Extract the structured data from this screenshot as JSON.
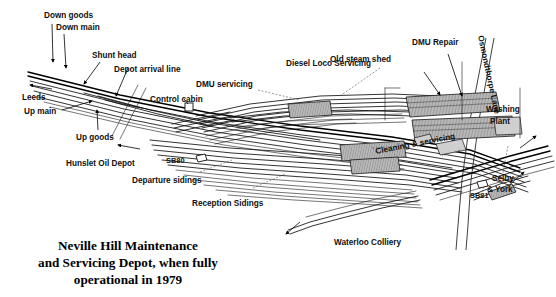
{
  "document": {
    "type": "railway-depot-track-diagram",
    "title_lines": [
      "Neville Hill Maintenance",
      "and Servicing Depot, when fully",
      "operational in 1979"
    ],
    "title_full": "Neville Hill Maintenance and Servicing Depot, when fully operational in 1979"
  },
  "colors": {
    "background": "#ffffff",
    "ink": "#111111",
    "building_fill": "#b9b9b9",
    "building_fill_light": "#cfcfcf",
    "leader_dash": "#555555"
  },
  "labels": {
    "down_goods": "Down goods",
    "down_main": "Down main",
    "shunt_head": "Shunt head",
    "depot_arrival_line": "Depot arrival line",
    "leeds": "Leeds",
    "up_main": "Up main",
    "up_goods": "Up goods",
    "control_cabin": "Control cabin",
    "dmu_servicing": "DMU servicing",
    "diesel_loco_servicing": "Diesel Loco Servicing",
    "old_steam_shed": "Old steam shed",
    "dmu_repair": "DMU Repair",
    "osmondthorpe_lane": "Osmondthorpe Lane",
    "washing_plant_l1": "Washing",
    "washing_plant_l2": "Plant",
    "cleaning_servicing": "Cleaning & servicing",
    "hunslet_oil_depot": "Hunslet Oil Depot",
    "sb80": "SB80",
    "sb81": "SB81",
    "departure_sidings": "Departure sidings",
    "reception_sidings": "Reception Sidings",
    "waterloo_colliery": "Waterloo Colliery",
    "selby_york_l1": "Selby",
    "selby_york_l2": "& York"
  },
  "features": [
    {
      "name": "down-goods",
      "kind": "track-label",
      "text": "Down goods"
    },
    {
      "name": "down-main",
      "kind": "track-label",
      "text": "Down main"
    },
    {
      "name": "shunt-head",
      "kind": "track-label",
      "text": "Shunt head"
    },
    {
      "name": "depot-arrival-line",
      "kind": "track-label",
      "text": "Depot arrival line"
    },
    {
      "name": "leeds",
      "kind": "direction-label",
      "text": "Leeds"
    },
    {
      "name": "up-main",
      "kind": "track-label",
      "text": "Up main"
    },
    {
      "name": "up-goods",
      "kind": "track-label",
      "text": "Up goods"
    },
    {
      "name": "control-cabin",
      "kind": "building",
      "text": "Control cabin"
    },
    {
      "name": "dmu-servicing",
      "kind": "facility",
      "text": "DMU servicing"
    },
    {
      "name": "diesel-loco-servicing",
      "kind": "facility",
      "text": "Diesel Loco Servicing"
    },
    {
      "name": "old-steam-shed",
      "kind": "building",
      "text": "Old steam shed"
    },
    {
      "name": "dmu-repair",
      "kind": "building",
      "text": "DMU Repair"
    },
    {
      "name": "osmondthorpe-lane",
      "kind": "road",
      "text": "Osmondthorpe Lane"
    },
    {
      "name": "washing-plant",
      "kind": "facility",
      "text": "Washing Plant"
    },
    {
      "name": "cleaning-servicing",
      "kind": "building",
      "text": "Cleaning & servicing"
    },
    {
      "name": "hunslet-oil-depot",
      "kind": "direction-label",
      "text": "Hunslet Oil Depot"
    },
    {
      "name": "signal-box-sb80",
      "kind": "signal-box",
      "text": "SB80"
    },
    {
      "name": "signal-box-sb81",
      "kind": "signal-box",
      "text": "SB81"
    },
    {
      "name": "departure-sidings",
      "kind": "sidings",
      "text": "Departure sidings"
    },
    {
      "name": "reception-sidings",
      "kind": "sidings",
      "text": "Reception Sidings"
    },
    {
      "name": "waterloo-colliery",
      "kind": "direction-label",
      "text": "Waterloo Colliery"
    },
    {
      "name": "selby-york",
      "kind": "direction-label",
      "text": "Selby & York"
    }
  ]
}
